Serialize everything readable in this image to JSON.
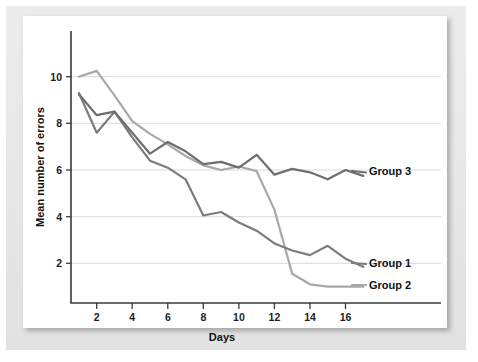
{
  "chart_data": {
    "type": "line",
    "title": "",
    "xlabel": "Days",
    "ylabel": "Mean number of errors",
    "xlim": [
      0.3,
      18.4
    ],
    "ylim": [
      0.2,
      11.2
    ],
    "xticks": [
      2,
      4,
      6,
      8,
      10,
      12,
      14,
      16
    ],
    "yticks": [
      2,
      4,
      6,
      8,
      10
    ],
    "grid": "horizontal",
    "legend_position": "right-inline-end-of-line",
    "x": [
      1,
      2,
      3,
      4,
      5,
      6,
      7,
      8,
      9,
      10,
      11,
      12,
      13,
      14,
      15,
      16,
      17
    ],
    "series": [
      {
        "name": "Group 1",
        "label": "Group 1",
        "color": "#7c7c7c",
        "values": [
          9.3,
          7.6,
          8.5,
          7.4,
          6.4,
          6.1,
          5.6,
          4.05,
          4.2,
          3.75,
          3.4,
          2.85,
          2.55,
          2.35,
          2.75,
          2.2,
          1.85
        ]
      },
      {
        "name": "Group 2",
        "label": "Group 2",
        "color": "#a8a8a8",
        "values": [
          10.0,
          10.25,
          9.2,
          8.1,
          7.55,
          7.1,
          6.6,
          6.2,
          6.0,
          6.15,
          5.95,
          4.3,
          1.55,
          1.1,
          1.0,
          1.0,
          1.0
        ]
      },
      {
        "name": "Group 3",
        "label": "Group 3",
        "color": "#6e6e6e",
        "values": [
          9.25,
          8.35,
          8.5,
          7.6,
          6.7,
          7.2,
          6.8,
          6.25,
          6.35,
          6.1,
          6.65,
          5.8,
          6.05,
          5.9,
          5.6,
          6.0,
          5.75
        ]
      }
    ]
  },
  "axes": {
    "x_title": "Days",
    "y_title": "Mean number of errors",
    "x_tick_labels": [
      "2",
      "4",
      "6",
      "8",
      "10",
      "12",
      "14",
      "16"
    ],
    "y_tick_labels": [
      "2",
      "4",
      "6",
      "8",
      "10"
    ]
  },
  "labels": {
    "group1": "Group 1",
    "group2": "Group 2",
    "group3": "Group 3"
  },
  "colors": {
    "group1": "#7c7c7c",
    "group2": "#a8a8a8",
    "group3": "#6e6e6e",
    "grid": "#d9d9d9",
    "axis": "#3a3a3a",
    "panel": "#e9e9e9",
    "card": "#ffffff"
  }
}
